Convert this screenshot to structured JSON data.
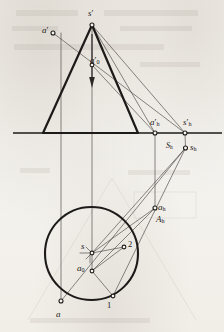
{
  "figure": {
    "type": "descriptive-geometry-projection-drawing",
    "title": "",
    "background_color": "#f4f2ee",
    "ink_color": "#1d1b19",
    "thin_line_color": "#4a4644",
    "ground_line": {
      "y": 133,
      "x_start": 13,
      "x_end": 222
    }
  },
  "labels": [
    {
      "name": "label-s-prime",
      "text": "s",
      "prime": "′",
      "sub": "",
      "x": 88,
      "y": 9,
      "size": "sz-main"
    },
    {
      "name": "label-a-prime",
      "text": "a",
      "prime": "′",
      "sub": "",
      "x": 42,
      "y": 26,
      "size": "sz-main"
    },
    {
      "name": "label-a0-prime",
      "text": "a",
      "prime": "′",
      "sub": "0",
      "x": 90,
      "y": 56,
      "size": "sz-main"
    },
    {
      "name": "label-ah-prime",
      "text": "a",
      "prime": "′",
      "sub": "h",
      "x": 150,
      "y": 118,
      "size": "sz-main"
    },
    {
      "name": "label-sh-prime",
      "text": "s",
      "prime": "′",
      "sub": "h",
      "x": 183,
      "y": 118,
      "size": "sz-main"
    },
    {
      "name": "label-capital-sh",
      "text": "S",
      "prime": "",
      "sub": "h",
      "x": 166,
      "y": 142,
      "size": "sz-small"
    },
    {
      "name": "label-sh",
      "text": "s",
      "prime": "",
      "sub": "h",
      "x": 190,
      "y": 143,
      "size": "sz-main"
    },
    {
      "name": "label-ah",
      "text": "a",
      "prime": "",
      "sub": "h",
      "x": 158,
      "y": 203,
      "size": "sz-main"
    },
    {
      "name": "label-ah-lower",
      "text": "A",
      "prime": "",
      "sub": "h",
      "x": 156,
      "y": 215,
      "size": "sz-main"
    },
    {
      "name": "label-s",
      "text": "s",
      "prime": "",
      "sub": "",
      "x": 81,
      "y": 242,
      "size": "sz-main"
    },
    {
      "name": "label-a0",
      "text": "a",
      "prime": "",
      "sub": "0",
      "x": 77,
      "y": 264,
      "size": "sz-main"
    },
    {
      "name": "label-a",
      "text": "a",
      "prime": "",
      "sub": "",
      "x": 56,
      "y": 310,
      "size": "sz-main"
    },
    {
      "name": "label-point-1",
      "text": "1",
      "prime": "",
      "sub": "",
      "x": 107,
      "y": 301,
      "size": "sz-num"
    },
    {
      "name": "label-point-2",
      "text": "2",
      "prime": "",
      "sub": "",
      "x": 128,
      "y": 240,
      "size": "sz-num"
    }
  ],
  "points": [
    {
      "name": "point-s-prime",
      "x": 92,
      "y": 25
    },
    {
      "name": "point-a-prime",
      "x": 53,
      "y": 33
    },
    {
      "name": "point-a0-prime",
      "x": 92,
      "y": 65
    },
    {
      "name": "point-ah-prime",
      "x": 155,
      "y": 133
    },
    {
      "name": "point-sh-prime",
      "x": 185,
      "y": 133
    },
    {
      "name": "point-sh",
      "x": 185.5,
      "y": 148
    },
    {
      "name": "point-ah",
      "x": 155,
      "y": 208
    },
    {
      "name": "point-s",
      "x": 92,
      "y": 253
    },
    {
      "name": "point-a0",
      "x": 92,
      "y": 271
    },
    {
      "name": "point-a",
      "x": 61,
      "y": 301
    },
    {
      "name": "point-1",
      "x": 113,
      "y": 296
    },
    {
      "name": "point-2",
      "x": 124,
      "y": 247
    }
  ],
  "circle": {
    "name": "base-circle",
    "cx": 91.5,
    "cy": 253.5,
    "r": 46.5
  },
  "triangle": {
    "name": "cone-outline-front-view",
    "apex": {
      "x": 92,
      "y": 25
    },
    "base_left": {
      "x": 43,
      "y": 133
    },
    "base_right": {
      "x": 138,
      "y": 133
    }
  }
}
